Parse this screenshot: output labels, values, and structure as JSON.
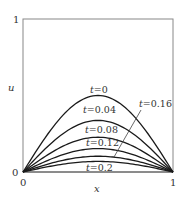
{
  "chart_data": {
    "type": "line",
    "title": "",
    "xlabel": "x",
    "ylabel": "u",
    "xlim": [
      0,
      1
    ],
    "ylim": [
      0,
      1
    ],
    "x_ticks": [
      "0",
      "1"
    ],
    "y_ticks": [
      "0",
      "1"
    ],
    "grid": false,
    "legend": "inline labels",
    "x": [
      0,
      0.1,
      0.2,
      0.3,
      0.4,
      0.5,
      0.6,
      0.7,
      0.8,
      0.9,
      1.0
    ],
    "series": [
      {
        "name": "t=0",
        "values": [
          0,
          0.155,
          0.294,
          0.405,
          0.476,
          0.5,
          0.476,
          0.405,
          0.294,
          0.155,
          0
        ]
      },
      {
        "name": "t=0.04",
        "values": [
          0,
          0.104,
          0.198,
          0.273,
          0.32,
          0.337,
          0.32,
          0.273,
          0.198,
          0.104,
          0
        ]
      },
      {
        "name": "t=0.08",
        "values": [
          0,
          0.07,
          0.133,
          0.184,
          0.216,
          0.227,
          0.216,
          0.184,
          0.133,
          0.07,
          0
        ]
      },
      {
        "name": "t=0.12",
        "values": [
          0,
          0.047,
          0.09,
          0.124,
          0.145,
          0.153,
          0.145,
          0.124,
          0.09,
          0.047,
          0
        ]
      },
      {
        "name": "t=0.16",
        "values": [
          0,
          0.032,
          0.061,
          0.083,
          0.098,
          0.103,
          0.098,
          0.083,
          0.061,
          0.032,
          0
        ]
      },
      {
        "name": "t=0.2",
        "values": [
          0,
          0.021,
          0.041,
          0.056,
          0.066,
          0.069,
          0.066,
          0.056,
          0.041,
          0.021,
          0
        ]
      }
    ],
    "annotations": [
      {
        "text": "t=0",
        "near": "peak of t=0 curve"
      },
      {
        "text": "t=0.04",
        "near": "peak of t=0.04 curve"
      },
      {
        "text": "t=0.08",
        "near": "peak of t=0.08 curve"
      },
      {
        "text": "t=0.12",
        "near": "peak of t=0.12 curve"
      },
      {
        "text": "t=0.16",
        "near": "upper right with leader line to t=0.16 curve"
      },
      {
        "text": "t=0.2",
        "near": "below t=0.2 curve"
      }
    ]
  },
  "labels": {
    "xlabel": "x",
    "ylabel": "u",
    "x_tick_0": "0",
    "x_tick_1": "1",
    "y_tick_0": "0",
    "y_tick_1": "1",
    "t0": "=0",
    "t004": "=0.04",
    "t008": "=0.08",
    "t012": "=0.12",
    "t016": "=0.16",
    "t02": "=0.2",
    "t_var": "t"
  }
}
